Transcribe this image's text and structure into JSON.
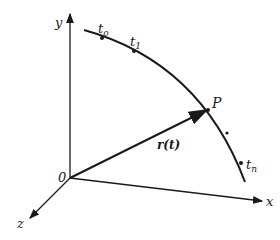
{
  "diagram": {
    "axes": {
      "x_label": "x",
      "y_label": "y",
      "z_label": "z",
      "origin_label": "0"
    },
    "curve_points": [
      {
        "label": "t",
        "subscript": "o"
      },
      {
        "label": "t",
        "subscript": "1"
      },
      {
        "label": "P",
        "subscript": ""
      },
      {
        "label": "t",
        "subscript": "n"
      }
    ],
    "vector_label": "r(t)",
    "colors": {
      "stroke": "#1a1a1a",
      "background": "#ffffff"
    }
  }
}
